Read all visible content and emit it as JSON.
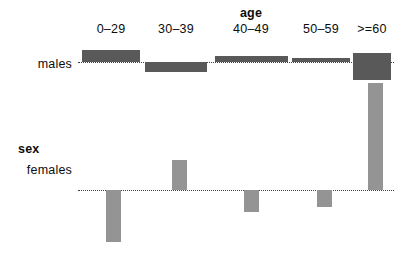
{
  "chart_data": {
    "type": "bar",
    "title": "",
    "xlabel": "age",
    "ylabel": "sex",
    "categories": [
      "0–29",
      "30–39",
      "40–49",
      "50–59",
      ">=60"
    ],
    "row_categories": [
      "males",
      "females"
    ],
    "grid": false,
    "legend": "none",
    "series": [
      {
        "name": "males",
        "baseline_y": 62,
        "color": "#595959",
        "values": [
          3.8,
          -3.0,
          1.1,
          0.7,
          -8.5
        ],
        "bars": [
          {
            "category": "0–29",
            "x": 82,
            "width": 58,
            "top": 50,
            "height": 12,
            "direction": "up",
            "residual": 3.8
          },
          {
            "category": "30–39",
            "x": 145,
            "width": 62,
            "top": 62,
            "height": 10,
            "direction": "down",
            "residual": -3.0
          },
          {
            "category": "40–49",
            "x": 215,
            "width": 73,
            "top": 56,
            "height": 6,
            "direction": "up",
            "residual": 1.1
          },
          {
            "category": "50–59",
            "x": 292,
            "width": 58,
            "top": 58,
            "height": 4,
            "direction": "up",
            "residual": 0.7
          },
          {
            "category": ">=60",
            "x": 353,
            "width": 38,
            "top": 53,
            "height": 27,
            "direction": "down",
            "residual": -8.5
          }
        ]
      },
      {
        "name": "females",
        "baseline_y": 190,
        "color": "#949494",
        "values": [
          -5.2,
          3.0,
          -2.2,
          -1.7,
          10.7
        ],
        "bars": [
          {
            "category": "0–29",
            "x": 106,
            "width": 15,
            "top": 190,
            "height": 52,
            "direction": "down",
            "residual": -5.2
          },
          {
            "category": "30–39",
            "x": 172,
            "width": 15,
            "top": 160,
            "height": 30,
            "direction": "up",
            "residual": 3.0
          },
          {
            "category": "40–49",
            "x": 244,
            "width": 15,
            "top": 190,
            "height": 22,
            "direction": "down",
            "residual": -2.2
          },
          {
            "category": "50–59",
            "x": 317,
            "width": 15,
            "top": 190,
            "height": 17,
            "direction": "down",
            "residual": -1.7
          },
          {
            "category": ">=60",
            "x": 368,
            "width": 15,
            "top": 83,
            "height": 107,
            "direction": "up",
            "residual": 10.7
          }
        ]
      }
    ],
    "baselines": [
      {
        "row": "males",
        "y": 62,
        "x": 78,
        "width": 316
      },
      {
        "row": "females",
        "y": 190,
        "x": 78,
        "width": 316
      }
    ],
    "column_label_positions": [
      111,
      176,
      251,
      321,
      372
    ],
    "column_label_y": 22,
    "xlabel_x": 251,
    "xlabel_y": 6,
    "row_label_positions": [
      {
        "label": "males",
        "x": 72,
        "y": 64
      },
      {
        "label": "females",
        "x": 72,
        "y": 170
      }
    ],
    "ylabel_x": 18,
    "ylabel_y": 142
  }
}
